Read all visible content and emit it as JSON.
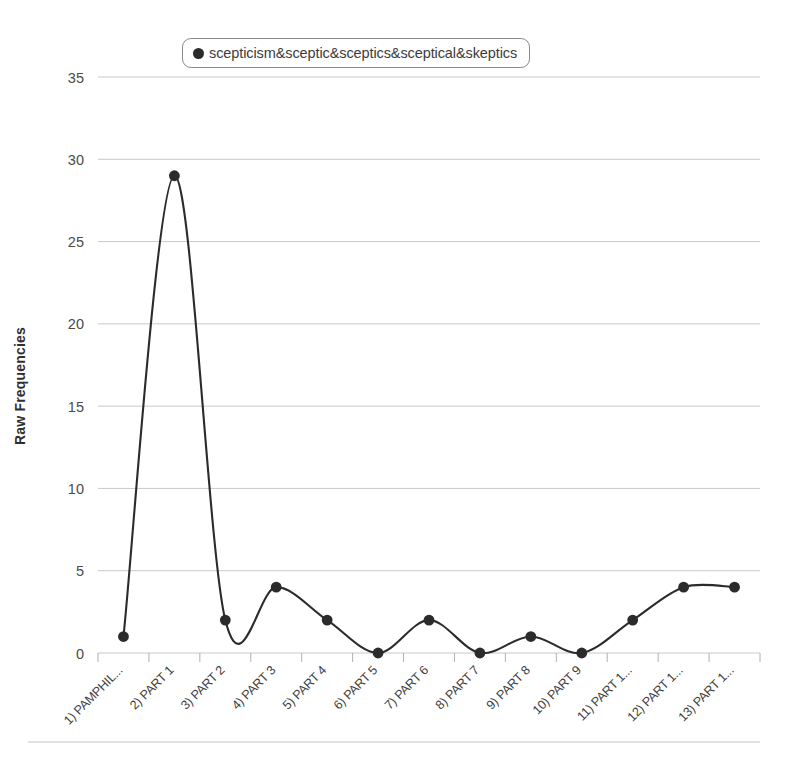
{
  "chart_data": {
    "type": "line",
    "title": "",
    "xlabel": "",
    "ylabel": "Raw Frequencies",
    "ylim": [
      0,
      35
    ],
    "ytick_values": [
      0,
      5,
      10,
      15,
      20,
      25,
      30,
      35
    ],
    "ytick_labels": [
      "0",
      "5",
      "10",
      "15",
      "20",
      "25",
      "30",
      "35"
    ],
    "grid": true,
    "grid_axis": "y",
    "legend_position": "top-center",
    "categories": [
      "1) PAMPHIL...",
      "2) PART 1",
      "3) PART 2",
      "4) PART 3",
      "5) PART 4",
      "6) PART 5",
      "7) PART 6",
      "8) PART 7",
      "9) PART 8",
      "10) PART 9",
      "11) PART 1...",
      "12) PART 1...",
      "13) PART 1..."
    ],
    "series": [
      {
        "name": "scepticism&sceptic&sceptics&sceptical&skeptics",
        "values": [
          1,
          29,
          2,
          4,
          2,
          0,
          2,
          0,
          1,
          0,
          2,
          4,
          4
        ],
        "color": "#2b2b2b",
        "marker": "circle",
        "smooth": true
      }
    ]
  },
  "legend": {
    "entries": [
      {
        "label": "scepticism&sceptic&sceptics&sceptical&skeptics",
        "marker_color": "#2b2b2b"
      }
    ]
  },
  "axes": {
    "y_title": "Raw Frequencies"
  },
  "colors": {
    "line": "#2b2b2b",
    "marker": "#2b2b2b",
    "gridline": "#c9c9c9",
    "axis": "#b0b0b0",
    "tick_text": "#4a4a4a",
    "background": "#ffffff",
    "legend_border": "#8a8a8a",
    "footer_rule": "#c4c4c4"
  }
}
